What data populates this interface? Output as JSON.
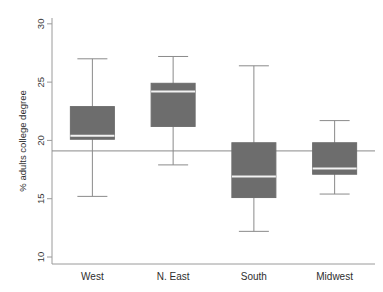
{
  "chart_data": {
    "type": "box",
    "title": "",
    "xlabel": "",
    "ylabel": "% adults college degree",
    "categories": [
      "West",
      "N. East",
      "South",
      "Midwest"
    ],
    "ylim": [
      9.4,
      30.5
    ],
    "yticks": [
      10,
      15,
      20,
      25,
      30
    ],
    "ytick_labels": [
      "10",
      "15",
      "20",
      "25",
      "30"
    ],
    "grid": false,
    "legend": "none",
    "reference_line": {
      "label": "",
      "value": 19.1,
      "orientation": "horizontal"
    },
    "boxes": [
      {
        "category": "West",
        "whisker_low": 15.2,
        "q1": 20.1,
        "median": 20.4,
        "q3": 22.9,
        "whisker_high": 27.0
      },
      {
        "category": "N. East",
        "whisker_low": 17.9,
        "q1": 21.2,
        "median": 24.2,
        "q3": 24.9,
        "whisker_high": 27.2
      },
      {
        "category": "South",
        "whisker_low": 12.2,
        "q1": 15.1,
        "median": 16.9,
        "q3": 19.8,
        "whisker_high": 26.4
      },
      {
        "category": "Midwest",
        "whisker_low": 15.4,
        "q1": 17.1,
        "median": 17.6,
        "q3": 19.8,
        "whisker_high": 21.7
      }
    ],
    "colors": {
      "box_fill": "#6d6d6d",
      "box_edge": "#6d6d6d",
      "median_line": "#f2f2f2",
      "whisker": "#8a8a8a",
      "axis": "#9a9a9a",
      "reference_line": "#8a8a8a",
      "background": "#ffffff"
    }
  }
}
